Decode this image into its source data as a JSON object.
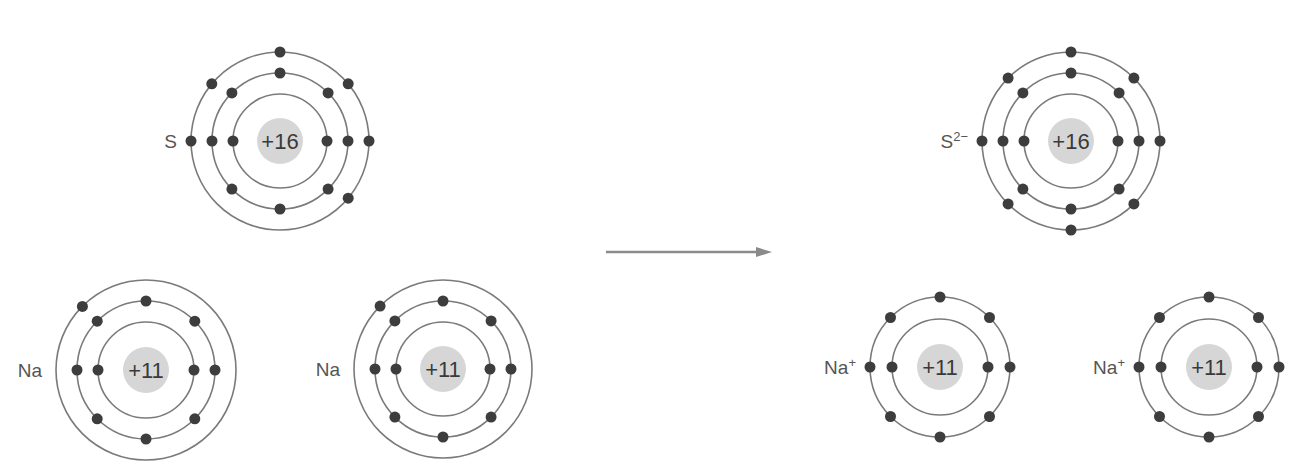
{
  "colors": {
    "shell": "#7a7a7a",
    "nucleus": "#d6d6d6",
    "electron": "#3d3d3d",
    "text": "#3a3a3a",
    "arrow": "#8a8a8a"
  },
  "reactants": [
    {
      "id": "sulfur-atom",
      "symbol": "S",
      "superscript": "",
      "nucleus_charge": "+16",
      "center": [
        280,
        141
      ],
      "shells": [
        {
          "radius": 47,
          "electrons": 2,
          "angles": [
            180,
            0
          ]
        },
        {
          "radius": 68,
          "electrons": 8,
          "angles": [
            90,
            135,
            180,
            225,
            270,
            315,
            0,
            45
          ]
        },
        {
          "radius": 89,
          "electrons": 6,
          "angles": [
            90,
            140,
            180,
            40,
            0,
            320
          ]
        }
      ]
    },
    {
      "id": "sodium-atom-1",
      "symbol": "Na",
      "superscript": "",
      "nucleus_charge": "+11",
      "center": [
        146,
        370
      ],
      "shells": [
        {
          "radius": 48,
          "electrons": 2,
          "angles": [
            180,
            0
          ]
        },
        {
          "radius": 69,
          "electrons": 8,
          "angles": [
            90,
            135,
            180,
            225,
            270,
            315,
            0,
            45
          ]
        },
        {
          "radius": 90,
          "electrons": 1,
          "angles": [
            135
          ]
        }
      ]
    },
    {
      "id": "sodium-atom-2",
      "symbol": "Na",
      "superscript": "",
      "nucleus_charge": "+11",
      "center": [
        443,
        369
      ],
      "shells": [
        {
          "radius": 47,
          "electrons": 2,
          "angles": [
            180,
            0
          ]
        },
        {
          "radius": 68,
          "electrons": 8,
          "angles": [
            90,
            135,
            180,
            225,
            270,
            315,
            0,
            45
          ]
        },
        {
          "radius": 89,
          "electrons": 1,
          "angles": [
            135
          ]
        }
      ]
    }
  ],
  "products": [
    {
      "id": "sulfide-ion",
      "symbol": "S",
      "superscript": "2−",
      "nucleus_charge": "+16",
      "center": [
        1071,
        141
      ],
      "shells": [
        {
          "radius": 47,
          "electrons": 2,
          "angles": [
            180,
            0
          ]
        },
        {
          "radius": 68,
          "electrons": 8,
          "angles": [
            90,
            135,
            180,
            225,
            270,
            315,
            0,
            45
          ]
        },
        {
          "radius": 89,
          "electrons": 8,
          "angles": [
            90,
            135,
            180,
            225,
            270,
            315,
            0,
            45
          ]
        }
      ]
    },
    {
      "id": "sodium-ion-1",
      "symbol": "Na",
      "superscript": "+",
      "nucleus_charge": "+11",
      "center": [
        940,
        367
      ],
      "shells": [
        {
          "radius": 48,
          "electrons": 2,
          "angles": [
            180,
            0
          ]
        },
        {
          "radius": 70,
          "electrons": 8,
          "angles": [
            90,
            135,
            180,
            225,
            270,
            315,
            0,
            45
          ]
        }
      ]
    },
    {
      "id": "sodium-ion-2",
      "symbol": "Na",
      "superscript": "+",
      "nucleus_charge": "+11",
      "center": [
        1209,
        367
      ],
      "shells": [
        {
          "radius": 48,
          "electrons": 2,
          "angles": [
            180,
            0
          ]
        },
        {
          "radius": 70,
          "electrons": 8,
          "angles": [
            90,
            135,
            180,
            225,
            270,
            315,
            0,
            45
          ]
        }
      ]
    }
  ],
  "arrow": {
    "from": [
      606,
      252
    ],
    "to": [
      772,
      252
    ],
    "direction": "right"
  },
  "nucleus_radius": 23,
  "electron_radius": 5.5
}
